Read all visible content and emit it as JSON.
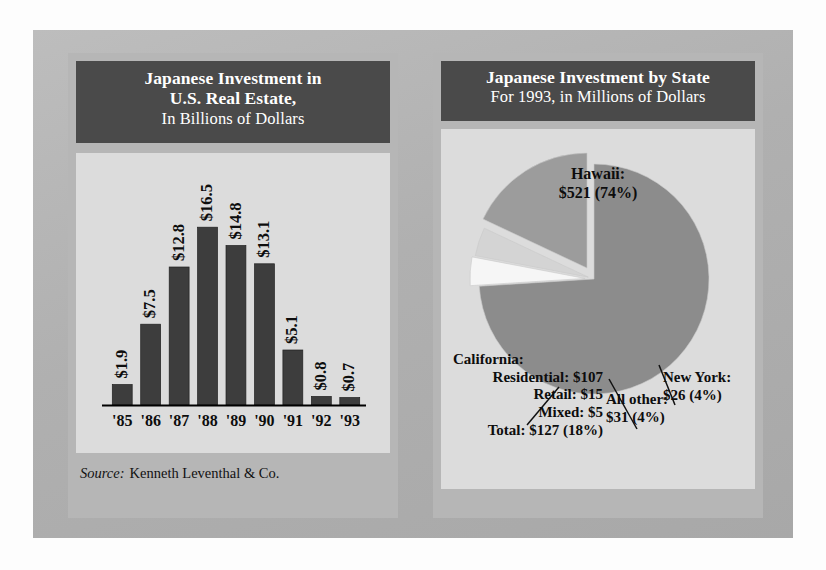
{
  "figure": {
    "background_color": "#b2b2b2",
    "panel_color": "#b6b6b6",
    "plot_color": "#dcdcdc",
    "title_band_color": "#4a4a4a"
  },
  "left_panel": {
    "title_line1": "Japanese Investment in",
    "title_line2": "U.S. Real Estate,",
    "title_line3": "In Billions of Dollars",
    "source_label": "Source:",
    "source_name": "Kenneth Leventhal & Co."
  },
  "right_panel": {
    "title_line1": "Japanese Investment by State",
    "title_line2": "For 1993, in Millions of Dollars"
  },
  "chart_data": [
    {
      "type": "bar",
      "title": "Japanese Investment in U.S. Real Estate, In Billions of Dollars",
      "xlabel": "",
      "ylabel": "Billions of Dollars",
      "categories": [
        "'85",
        "'86",
        "'87",
        "'88",
        "'89",
        "'90",
        "'91",
        "'92",
        "'93"
      ],
      "values": [
        1.9,
        7.5,
        12.8,
        16.5,
        14.8,
        13.1,
        5.1,
        0.8,
        0.7
      ],
      "data_labels": [
        "$1.9",
        "$7.5",
        "$12.8",
        "$16.5",
        "$14.8",
        "$13.1",
        "$5.1",
        "$0.8",
        "$0.7"
      ],
      "ylim": [
        0,
        18
      ],
      "grid": false,
      "legend": "none",
      "bar_color": "#3d3d3d",
      "axis_color": "#000000",
      "plot_background": "#dcdcdc",
      "source": "Source: Kenneth Leventhal & Co."
    },
    {
      "type": "pie",
      "title": "Japanese Investment by State",
      "subtitle": "For 1993, in Millions of Dollars",
      "units": "millions of dollars",
      "legend": "labels-on-chart",
      "slices": [
        {
          "name": "Hawaii",
          "value": 521,
          "percent": 74,
          "label_line1": "Hawaii:",
          "label_line2": "$521 (74%)",
          "color": "#8c8c8c",
          "exploded": false
        },
        {
          "name": "California",
          "value": 127,
          "percent": 18,
          "label_line1": "California:",
          "label_line2": "Total:  $127 (18%)",
          "color": "#9c9c9c",
          "exploded": true
        },
        {
          "name": "All other",
          "value": 31,
          "percent": 4,
          "label_line1": "All other:",
          "label_line2": "$31 (4%)",
          "color": "#d4d4d4",
          "exploded": true
        },
        {
          "name": "New York",
          "value": 26,
          "percent": 4,
          "label_line1": "New York:",
          "label_line2": "$26 (4%)",
          "color": "#f6f6f6",
          "exploded": true
        }
      ],
      "california_breakdown": [
        {
          "label": "Residential:",
          "amount": "$107"
        },
        {
          "label": "Retail:",
          "amount": "$15"
        },
        {
          "label": "Mixed:",
          "amount": "$5"
        },
        {
          "label": "Total:",
          "amount": "$127 (18%)"
        }
      ]
    }
  ],
  "pie_labels": {
    "hawaii_l1": "Hawaii:",
    "hawaii_l2": "$521 (74%)",
    "california_head": "California:",
    "california_r1": "Residential:  $107",
    "california_r2": "Retail:  $15",
    "california_r3": "Mixed:  $5",
    "california_r4": "Total:  $127 (18%)",
    "allother_l1": "All other:",
    "allother_l2": "$31 (4%)",
    "newyork_l1": "New York:",
    "newyork_l2": "$26 (4%)"
  }
}
